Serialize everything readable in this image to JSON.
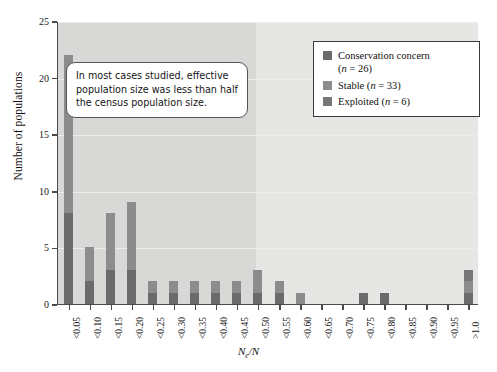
{
  "chart_data": {
    "type": "bar",
    "subtype": "stacked-histogram",
    "title": "",
    "xlabel": "Ne/N",
    "ylabel": "Number of populations",
    "ylim": [
      0,
      25
    ],
    "yticks": [
      0,
      5,
      10,
      15,
      20,
      25
    ],
    "grid": true,
    "legend_position": "top-right",
    "categories": [
      "<0.05",
      "<0.10",
      "<0.15",
      "<0.20",
      "<0.25",
      "<0.30",
      "<0.35",
      "<0.40",
      "<0.45",
      "<0.50",
      "<0.55",
      "<0.60",
      "<0.65",
      "<0.70",
      "<0.75",
      "<0.80",
      "<0.85",
      "<0.90",
      "<0.95",
      ">1.0"
    ],
    "values": [
      22,
      5,
      8,
      9,
      2,
      2,
      2,
      2,
      2,
      3,
      2,
      1,
      0,
      0,
      1,
      1,
      0,
      0,
      0,
      3
    ],
    "series": [
      {
        "name": "Conservation concern",
        "n": 26,
        "color": "#6b6b6b",
        "values": [
          8,
          2,
          3,
          3,
          1,
          1,
          1,
          1,
          1,
          1,
          1,
          0,
          0,
          0,
          1,
          1,
          0,
          0,
          0,
          1
        ]
      },
      {
        "name": "Stable",
        "n": 33,
        "color": "#8c8c8c",
        "values": [
          14,
          3,
          5,
          6,
          1,
          1,
          1,
          1,
          1,
          2,
          1,
          1,
          0,
          0,
          0,
          0,
          0,
          0,
          0,
          1
        ]
      },
      {
        "name": "Exploited",
        "n": 6,
        "color": "#767676",
        "values": [
          0,
          0,
          0,
          0,
          0,
          0,
          0,
          0,
          0,
          0,
          0,
          0,
          0,
          0,
          0,
          0,
          0,
          0,
          0,
          1
        ]
      }
    ],
    "annotation": "In most cases studied, effective population size was less than half the census population size."
  },
  "axes": {
    "y_title": "Number of populations",
    "x_title_main": "N",
    "x_title_sub": "e",
    "x_title_rest": "/N"
  },
  "legend": {
    "items": [
      {
        "label": "Conservation concern",
        "count_text": "(n = 26)",
        "color": "#6b6b6b",
        "inline": false
      },
      {
        "label": "Stable",
        "count_text": "(n = 33)",
        "color": "#8c8c8c",
        "inline": true
      },
      {
        "label": "Exploited",
        "count_text": "(n = 6)",
        "color": "#767676",
        "inline": true
      }
    ]
  },
  "callout": {
    "text": "In most cases studied, effective population size was less than half the census population size."
  }
}
